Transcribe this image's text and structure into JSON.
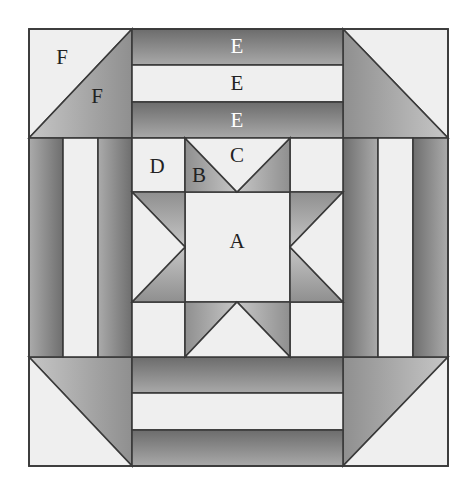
{
  "diagram": {
    "type": "quilt-block",
    "colors": {
      "outline": "#3a3a3a",
      "light": "#efefef",
      "dark_start": "#6e6e6e",
      "dark_end": "#a8a8a8",
      "mid_start": "#909090",
      "mid_end": "#c4c4c4",
      "label_dark": "#222222",
      "label_light": "#ffffff"
    },
    "labels": [
      {
        "text": "F",
        "x": 62,
        "y": 57,
        "color": "label_dark",
        "piece": "corner-light-triangle"
      },
      {
        "text": "F",
        "x": 97,
        "y": 96,
        "color": "label_dark",
        "piece": "corner-dark-triangle"
      },
      {
        "text": "E",
        "x": 237,
        "y": 46,
        "color": "label_light",
        "piece": "border-strip-dark-top"
      },
      {
        "text": "E",
        "x": 237,
        "y": 83,
        "color": "label_dark",
        "piece": "border-strip-light"
      },
      {
        "text": "E",
        "x": 237,
        "y": 120,
        "color": "label_light",
        "piece": "border-strip-dark-bottom"
      },
      {
        "text": "D",
        "x": 157,
        "y": 166,
        "color": "label_dark",
        "piece": "star-corner-square"
      },
      {
        "text": "B",
        "x": 199,
        "y": 175,
        "color": "label_dark",
        "piece": "star-point-triangle"
      },
      {
        "text": "C",
        "x": 237,
        "y": 155,
        "color": "label_dark",
        "piece": "star-background-triangle"
      },
      {
        "text": "A",
        "x": 237,
        "y": 241,
        "color": "label_dark",
        "piece": "star-center-square"
      }
    ]
  }
}
